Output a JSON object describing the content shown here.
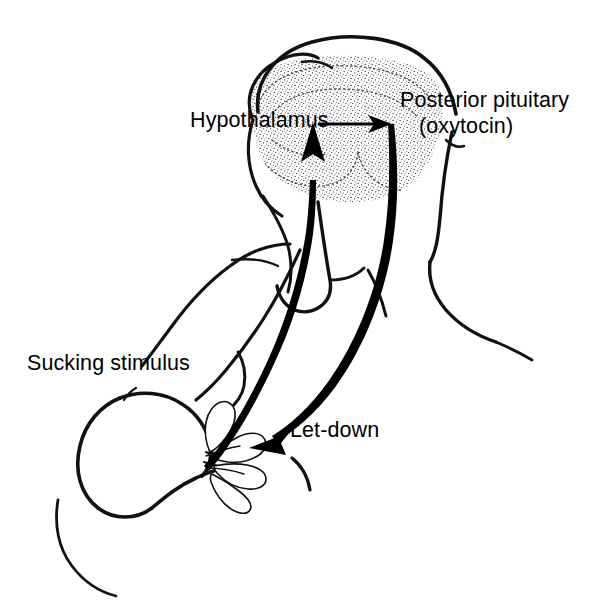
{
  "figure": {
    "background_color": "#ffffff",
    "ink_color": "#111111",
    "style": "black-and-white line drawing with stippled brain region"
  },
  "labels": {
    "hypothalamus": "Hypothalamus",
    "posterior_pituitary": "Posterior pituitary",
    "oxytocin": "(oxytocin)",
    "sucking_stimulus": "Sucking stimulus",
    "let_down": "Let-down"
  },
  "arrows": [
    {
      "name": "afferent-sucking-arrow",
      "from": "nipple / breast",
      "to": "hypothalamus",
      "direction": "upward",
      "style": "thick tapered curve with solid arrowhead"
    },
    {
      "name": "hypothalamus-to-pituitary-arrow",
      "from": "hypothalamus",
      "to": "posterior pituitary",
      "direction": "rightward",
      "style": "thin straight line with solid arrowhead"
    },
    {
      "name": "efferent-letdown-arrow",
      "from": "posterior pituitary",
      "to": "breast alveoli",
      "direction": "downward-left",
      "style": "thick tapered curve with solid arrowhead"
    }
  ],
  "anatomy": [
    {
      "name": "head-and-hair-outline"
    },
    {
      "name": "face-and-jaw-outline"
    },
    {
      "name": "neck-outline"
    },
    {
      "name": "back-and-shoulder-outline"
    },
    {
      "name": "arm-outline"
    },
    {
      "name": "breast-outline"
    },
    {
      "name": "nipple"
    },
    {
      "name": "mammary-alveoli",
      "count": 4
    },
    {
      "name": "infant-head-arc"
    },
    {
      "name": "torso-underline"
    }
  ],
  "brain_region": {
    "name": "stippled-brain-region",
    "description": "shaded hypothalamic-pituitary area inside the skull",
    "texture": "fine stipple dots with dashed contour lines"
  }
}
